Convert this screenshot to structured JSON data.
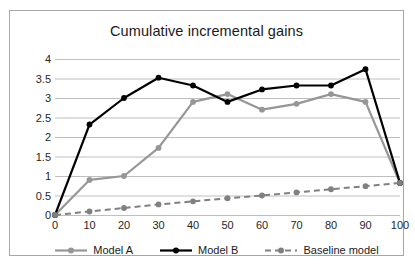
{
  "chart_data": {
    "type": "line",
    "title": "Cumulative incremental gains",
    "xlabel": "",
    "ylabel": "",
    "x": [
      0,
      10,
      20,
      30,
      40,
      50,
      60,
      70,
      80,
      90,
      100
    ],
    "xtick_labels": [
      "0",
      "10",
      "20",
      "30",
      "40",
      "50",
      "60",
      "70",
      "80",
      "90",
      "100"
    ],
    "ytick_labels": [
      "0",
      "0.5",
      "1",
      "1.5",
      "2",
      "2.5",
      "3",
      "3.5",
      "4"
    ],
    "yticks": [
      0,
      0.5,
      1,
      1.5,
      2,
      2.5,
      3,
      3.5,
      4
    ],
    "xlim": [
      0,
      100
    ],
    "ylim": [
      0,
      4
    ],
    "grid": "horizontal",
    "legend_position": "bottom",
    "series": [
      {
        "name": "Model A",
        "color": "#969696",
        "style": "solid",
        "marker": "circle",
        "values": [
          0,
          0.9,
          1.0,
          1.72,
          2.9,
          3.1,
          2.7,
          2.85,
          3.1,
          2.9,
          0.82
        ]
      },
      {
        "name": "Model B",
        "color": "#000000",
        "style": "solid",
        "marker": "circle",
        "values": [
          0,
          2.32,
          3.0,
          3.52,
          3.32,
          2.9,
          3.22,
          3.32,
          3.32,
          3.74,
          0.82
        ]
      },
      {
        "name": "Baseline model",
        "color": "#808080",
        "style": "dashed",
        "marker": "circle",
        "values": [
          0,
          0.09,
          0.18,
          0.27,
          0.35,
          0.43,
          0.5,
          0.58,
          0.66,
          0.74,
          0.82
        ]
      }
    ]
  },
  "colors": {
    "frame": "#a6a6a6",
    "grid": "#bfbfbf",
    "text": "#1a1a1a",
    "background": "#ffffff"
  }
}
